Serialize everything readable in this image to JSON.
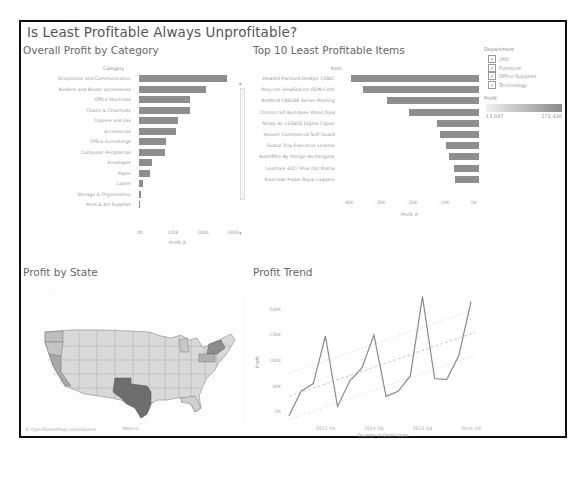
{
  "dashboard": {
    "title": "Is Least Profitable Always Unprofitable?"
  },
  "panels": {
    "category": {
      "title": "Overall Profit by Category",
      "header": "Category",
      "axis_label": "Profit",
      "ticks": [
        "0K",
        "100K",
        "200K",
        "300K"
      ]
    },
    "items": {
      "title": "Top 10 Least Profitable Items",
      "header": "Item",
      "axis_label": "Profit",
      "ticks": [
        "-40K",
        "-30K",
        "-20K",
        "-10K",
        "0K"
      ]
    },
    "state": {
      "title": "Profit by State",
      "map_label_mexico": "Mexico",
      "attribution": "© OpenStreetMap contributors"
    },
    "trend": {
      "title": "Profit Trend",
      "ylabel": "Profit",
      "xlabel": "Quarter of Order Date",
      "yticks": [
        "200K",
        "150K",
        "100K",
        "50K",
        "0K"
      ],
      "xticks": [
        "2013 Q4",
        "2014 Q4",
        "2015 Q4",
        "2016 Q4"
      ]
    }
  },
  "legend": {
    "department_title": "Department",
    "departments": [
      {
        "label": "(All)",
        "checked": true
      },
      {
        "label": "Furniture",
        "checked": true
      },
      {
        "label": "Office Supplies",
        "checked": true
      },
      {
        "label": "Technology",
        "checked": true
      }
    ],
    "profit_title": "Profit",
    "profit_min": "-13,047",
    "profit_max": "172,426",
    "colors": {
      "low": "#f0f0f0",
      "high": "#8a8a8a"
    }
  },
  "chart_data": [
    {
      "type": "bar",
      "title": "Overall Profit by Category",
      "xlabel": "Profit",
      "ylabel": "Category",
      "categories": [
        "Telephones and Communication",
        "Binders and Binder Accessories",
        "Office Machines",
        "Chairs & Chairmats",
        "Copiers and Fax",
        "Accessories",
        "Office Furnishings",
        "Computer Peripherals",
        "Envelopes",
        "Paper",
        "Labels",
        "Storage & Organization",
        "Pens & Art Supplies"
      ],
      "values": [
        316000,
        240000,
        183000,
        182000,
        140000,
        133000,
        97000,
        95000,
        48000,
        38000,
        13000,
        6000,
        1000
      ],
      "xlim": [
        0,
        330000
      ]
    },
    {
      "type": "bar",
      "title": "Top 10 Least Profitable Items",
      "xlabel": "Profit",
      "ylabel": "Item",
      "categories": [
        "Hewlett-Packard Deskjet 1200C",
        "Polycom ViewStation ISDN Conf.",
        "Bretford CR8500 Series Meeting",
        "Chromcraft Bull-Nose Wood Oval",
        "Sharp AL-1530CS Digital Copier",
        "Hoover Commercial Soft Guard",
        "Global Troy Executive Leather",
        "BoxOffice By Design Rectangular",
        "Lexmark 4227 Plus Dot Matrix",
        "Riverside Palais Royal Lawyers"
      ],
      "values": [
        -43000,
        -39000,
        -31000,
        -23500,
        -14000,
        -13000,
        -11000,
        -10000,
        -8500,
        -8000
      ],
      "xlim": [
        -45000,
        0
      ]
    },
    {
      "type": "line",
      "title": "Profit Trend",
      "xlabel": "Quarter of Order Date",
      "ylabel": "Profit",
      "x": [
        "2013 Q1",
        "2013 Q2",
        "2013 Q3",
        "2013 Q4",
        "2014 Q1",
        "2014 Q2",
        "2014 Q3",
        "2014 Q4",
        "2015 Q1",
        "2015 Q2",
        "2015 Q3",
        "2015 Q4",
        "2016 Q1",
        "2016 Q2",
        "2016 Q3",
        "2016 Q4"
      ],
      "series": [
        {
          "name": "Profit",
          "values": [
            -8000,
            40000,
            55000,
            148000,
            10000,
            60000,
            85000,
            150000,
            30000,
            40000,
            70000,
            225000,
            65000,
            63000,
            110000,
            215000
          ]
        }
      ],
      "trend_line": {
        "start": 30000,
        "end": 155000
      },
      "ylim": [
        -20000,
        230000
      ]
    }
  ]
}
